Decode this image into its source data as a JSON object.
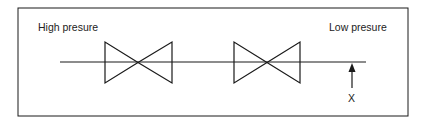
{
  "diagram": {
    "labels": {
      "high_pressure": "High presure",
      "low_pressure": "Low presure",
      "measurement_point": "X"
    },
    "elements": {
      "pipe": "horizontal pipe line",
      "valves": [
        "valve-1",
        "valve-2"
      ],
      "arrow": "up arrow indicating point X"
    },
    "colors": {
      "stroke": "#1a1a1a",
      "background": "#ffffff"
    }
  }
}
